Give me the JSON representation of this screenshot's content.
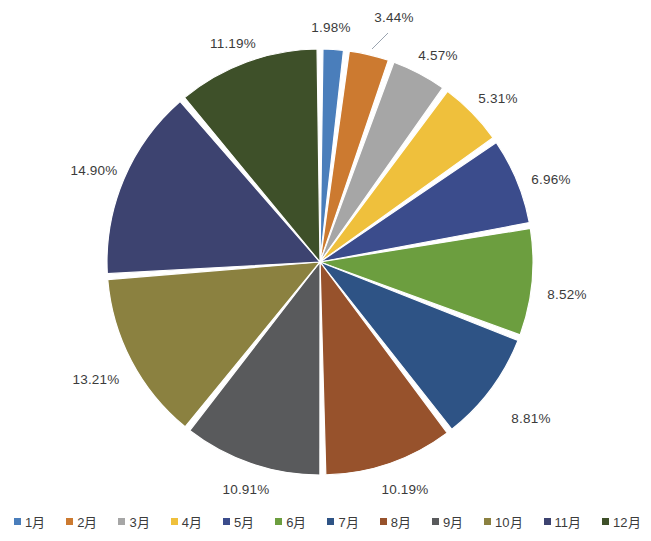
{
  "chart_data": {
    "type": "pie",
    "title": "",
    "categories": [
      "1月",
      "2月",
      "3月",
      "4月",
      "5月",
      "6月",
      "7月",
      "8月",
      "9月",
      "10月",
      "11月",
      "12月"
    ],
    "values": [
      1.98,
      3.44,
      4.57,
      5.31,
      6.96,
      8.52,
      8.81,
      10.19,
      10.91,
      13.21,
      14.9,
      11.19
    ],
    "value_labels": [
      "1.98%",
      "3.44%",
      "4.57%",
      "5.31%",
      "6.96%",
      "8.52%",
      "8.81%",
      "10.19%",
      "10.91%",
      "13.21%",
      "14.90%",
      "11.19%"
    ],
    "unit": "%",
    "colors": [
      "#4A7EBB",
      "#CC7A30",
      "#A6A6A6",
      "#EFC03C",
      "#3B4C8C",
      "#6C9E3F",
      "#2E5385",
      "#97522C",
      "#595A5C",
      "#8B8140",
      "#3D4370",
      "#3E5029"
    ],
    "legend_position": "bottom",
    "start_angle_deg": -90,
    "direction": "clockwise",
    "gap_deg": 1.6,
    "labels_outside": true
  },
  "legend": {
    "items": [
      {
        "label": "1月",
        "color": "#4A7EBB"
      },
      {
        "label": "2月",
        "color": "#CC7A30"
      },
      {
        "label": "3月",
        "color": "#A6A6A6"
      },
      {
        "label": "4月",
        "color": "#EFC03C"
      },
      {
        "label": "5月",
        "color": "#3B4C8C"
      },
      {
        "label": "6月",
        "color": "#6C9E3F"
      },
      {
        "label": "7月",
        "color": "#2E5385"
      },
      {
        "label": "8月",
        "color": "#97522C"
      },
      {
        "label": "9月",
        "color": "#595A5C"
      },
      {
        "label": "10月",
        "color": "#8B8140"
      },
      {
        "label": "11月",
        "color": "#3D4370"
      },
      {
        "label": "12月",
        "color": "#3E5029"
      }
    ]
  },
  "labels": [
    {
      "text": "1.98%",
      "x": 331,
      "y": 27
    },
    {
      "text": "3.44%",
      "x": 394,
      "y": 17
    },
    {
      "text": "4.57%",
      "x": 438,
      "y": 55
    },
    {
      "text": "5.31%",
      "x": 498,
      "y": 98
    },
    {
      "text": "6.96%",
      "x": 551,
      "y": 179
    },
    {
      "text": "8.52%",
      "x": 567,
      "y": 294
    },
    {
      "text": "8.81%",
      "x": 531,
      "y": 418
    },
    {
      "text": "10.19%",
      "x": 405,
      "y": 489
    },
    {
      "text": "10.91%",
      "x": 246,
      "y": 489
    },
    {
      "text": "13.21%",
      "x": 96,
      "y": 379
    },
    {
      "text": "14.90%",
      "x": 94,
      "y": 170
    },
    {
      "text": "11.19%",
      "x": 233,
      "y": 43
    }
  ],
  "geometry": {
    "center_x": 320,
    "center_y": 262,
    "radius": 213
  }
}
